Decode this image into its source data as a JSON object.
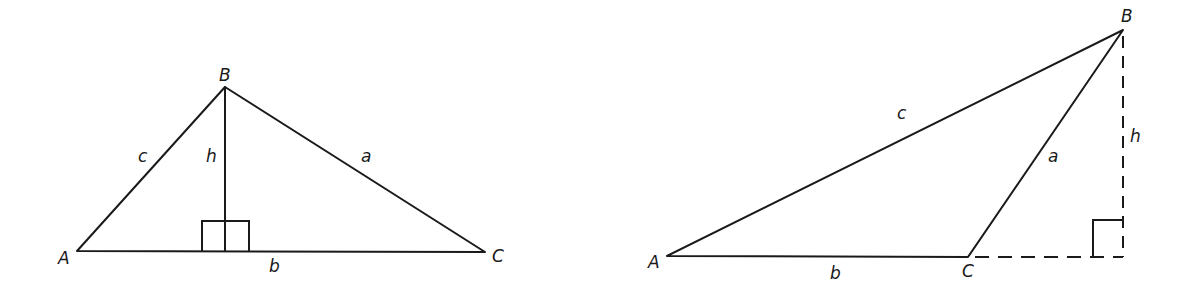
{
  "figures": [
    {
      "id": "acute-triangle",
      "description": "Triangle ABC with altitude h dropped from B perpendicular to side b (AC), foot lies inside AC",
      "vertices": {
        "A": {
          "label": "A"
        },
        "B": {
          "label": "B"
        },
        "C": {
          "label": "C"
        }
      },
      "sides": {
        "a": {
          "label": "a",
          "between": "B-C"
        },
        "b": {
          "label": "b",
          "between": "A-C"
        },
        "c": {
          "label": "c",
          "between": "A-B"
        }
      },
      "altitude": {
        "label": "h",
        "style": "solid"
      },
      "right_angle_marker": true
    },
    {
      "id": "obtuse-triangle",
      "description": "Obtuse triangle ABC with altitude h from B falling outside the triangle onto the extension of side b",
      "vertices": {
        "A": {
          "label": "A"
        },
        "B": {
          "label": "B"
        },
        "C": {
          "label": "C"
        }
      },
      "sides": {
        "a": {
          "label": "a",
          "between": "B-C"
        },
        "b": {
          "label": "b",
          "between": "A-C"
        },
        "c": {
          "label": "c",
          "between": "A-B"
        }
      },
      "altitude": {
        "label": "h",
        "style": "dashed"
      },
      "extension": {
        "style": "dashed"
      },
      "right_angle_marker": true
    }
  ]
}
